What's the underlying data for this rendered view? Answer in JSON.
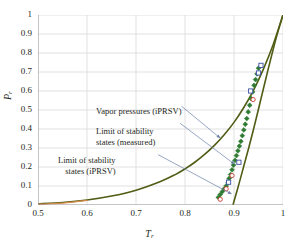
{
  "figure": {
    "background": "#ffffff",
    "width": 299,
    "height": 248
  },
  "chart_data": {
    "type": "line",
    "title": "",
    "xlabel": "T_r",
    "ylabel": "P_r",
    "xlim": [
      0.5,
      1.0
    ],
    "ylim": [
      0.0,
      1.0
    ],
    "xticks": [
      "0.5",
      "0.6",
      "0.7",
      "0.8",
      "0.9",
      "1"
    ],
    "xtick_values": [
      0.5,
      0.6,
      0.7,
      0.8,
      0.9,
      1.0
    ],
    "yticks": [
      "0",
      "0.1",
      "0.2",
      "0.3",
      "0.4",
      "0.5",
      "0.6",
      "0.7",
      "0.8",
      "0.9",
      "1"
    ],
    "ytick_values": [
      0,
      0.1,
      0.2,
      0.3,
      0.4,
      0.5,
      0.6,
      0.7,
      0.8,
      0.9,
      1.0
    ],
    "grid": true,
    "grid_color": "#d9d9d9",
    "legend": "none",
    "series": [
      {
        "name": "Vapor pressures (iPRSV)",
        "kind": "curve",
        "color": "#4f5d15",
        "linewidth": 1.6,
        "x": [
          0.5,
          0.55,
          0.6,
          0.65,
          0.7,
          0.75,
          0.78,
          0.8,
          0.82,
          0.84,
          0.86,
          0.88,
          0.9,
          0.92,
          0.94,
          0.96,
          0.98,
          1.0
        ],
        "y": [
          0.006,
          0.013,
          0.026,
          0.047,
          0.078,
          0.124,
          0.16,
          0.19,
          0.225,
          0.266,
          0.314,
          0.37,
          0.435,
          0.513,
          0.605,
          0.715,
          0.845,
          1.0
        ]
      },
      {
        "name": "Limit of stability states (iPRSV)",
        "kind": "curve",
        "color": "#4f5d15",
        "linewidth": 1.6,
        "x": [
          0.898,
          0.9,
          0.91,
          0.92,
          0.93,
          0.94,
          0.95,
          0.96,
          0.97,
          0.98,
          0.99,
          1.0
        ],
        "y": [
          0.0,
          0.02,
          0.11,
          0.205,
          0.3,
          0.4,
          0.505,
          0.612,
          0.718,
          0.82,
          0.915,
          1.0
        ]
      },
      {
        "name": "Saturation low-temperature branch",
        "kind": "curve",
        "color": "#d98b4a",
        "linewidth": 1.3,
        "x": [
          0.5,
          0.52,
          0.54,
          0.56,
          0.58,
          0.6
        ],
        "y": [
          0.004,
          0.006,
          0.009,
          0.013,
          0.018,
          0.024
        ]
      },
      {
        "name": "Limit of stability states (measured)",
        "kind": "scatter",
        "color": "#2f7b32",
        "marker": "diamond",
        "x": [
          0.868,
          0.872,
          0.876,
          0.88,
          0.884,
          0.888,
          0.89,
          0.893,
          0.896,
          0.899,
          0.902,
          0.905,
          0.908,
          0.911,
          0.914,
          0.917,
          0.92,
          0.923,
          0.926,
          0.929,
          0.932,
          0.935,
          0.938,
          0.941,
          0.944,
          0.947,
          0.95
        ],
        "y": [
          0.04,
          0.055,
          0.07,
          0.085,
          0.1,
          0.12,
          0.14,
          0.16,
          0.185,
          0.21,
          0.235,
          0.26,
          0.285,
          0.31,
          0.335,
          0.365,
          0.395,
          0.425,
          0.455,
          0.49,
          0.525,
          0.56,
          0.595,
          0.63,
          0.66,
          0.69,
          0.72
        ]
      },
      {
        "name": "Measured points (blue squares)",
        "kind": "scatter",
        "color": "#3b4fa0",
        "marker": "square",
        "x": [
          0.889,
          0.91,
          0.934,
          0.95,
          0.955
        ],
        "y": [
          0.12,
          0.225,
          0.6,
          0.695,
          0.735
        ]
      },
      {
        "name": "Measured points (red circles)",
        "kind": "scatter",
        "color": "#cf3b33",
        "marker": "circle",
        "x": [
          0.872,
          0.884,
          0.896,
          0.939
        ],
        "y": [
          0.03,
          0.085,
          0.155,
          0.555
        ]
      }
    ],
    "annotations": [
      {
        "id": "vapor",
        "lines": [
          "Vapor pressures (iPRSV)"
        ],
        "text": "Vapor pressures (iPRSV)",
        "leader_from": [
          0.793,
          0.52
        ],
        "leader_to": [
          0.872,
          0.352
        ]
      },
      {
        "id": "measured",
        "lines": [
          "Limit of stability",
          "states (measured)"
        ],
        "text": "Limit of stability states (measured)",
        "leader_from": [
          0.79,
          0.43
        ],
        "leader_to": [
          0.901,
          0.215
        ]
      },
      {
        "id": "iprsv",
        "lines": [
          "Limit of stability",
          "states (iPRSV)"
        ],
        "text": "Limit of stability states (iPRSV)",
        "leader_from": [
          0.745,
          0.265
        ],
        "leader_to": [
          0.895,
          0.058
        ]
      }
    ],
    "annotation_leader_color": "#6a7fa8"
  },
  "axes": {
    "x_title_main": "T",
    "x_title_sub": "r",
    "y_title_main": "P",
    "y_title_sub": "r"
  }
}
